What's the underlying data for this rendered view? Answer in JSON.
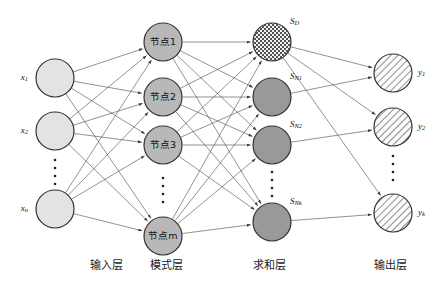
{
  "diagram": {
    "layers": [
      {
        "id": "input",
        "label": "输入层",
        "label_x": 106,
        "fill": "#e3e3e3",
        "pattern": "solid",
        "nodes": [
          {
            "name": "x1",
            "base": "x",
            "sub": "1",
            "cx": 55,
            "cy": 78,
            "r": 19
          },
          {
            "name": "x2",
            "base": "x",
            "sub": "2",
            "cx": 55,
            "cy": 131,
            "r": 19
          },
          {
            "name": "xn",
            "base": "x",
            "sub": "n",
            "cx": 55,
            "cy": 209,
            "r": 19
          }
        ],
        "ellipsis": {
          "cx": 55,
          "cy": 172
        }
      },
      {
        "id": "pattern",
        "label": "模式层",
        "label_x": 166,
        "fill": "#b8b8b8",
        "pattern": "solid",
        "nodes": [
          {
            "name": "pattern-node-1",
            "text": "节点1",
            "cx": 163,
            "cy": 42,
            "r": 19
          },
          {
            "name": "pattern-node-2",
            "text": "节点2",
            "cx": 163,
            "cy": 97,
            "r": 19
          },
          {
            "name": "pattern-node-3",
            "text": "节点3",
            "cx": 163,
            "cy": 145,
            "r": 19
          },
          {
            "name": "pattern-node-m",
            "text": "节点m",
            "cx": 163,
            "cy": 236,
            "r": 19
          }
        ],
        "ellipsis": {
          "cx": 163,
          "cy": 190
        }
      },
      {
        "id": "summation",
        "label": "求和层",
        "label_x": 269,
        "fill": "#999999",
        "pattern": "mixed",
        "nodes": [
          {
            "name": "sum-node-D",
            "base": "S",
            "sub": "D",
            "cx": 272,
            "cy": 42,
            "r": 19,
            "fill_kind": "checker",
            "label_dx": 18,
            "label_dy": -20
          },
          {
            "name": "sum-node-N1",
            "base": "S",
            "sub": "N1",
            "cx": 272,
            "cy": 97,
            "r": 19,
            "fill_kind": "dark",
            "label_dx": 18,
            "label_dy": -20
          },
          {
            "name": "sum-node-N2",
            "base": "S",
            "sub": "N2",
            "cx": 272,
            "cy": 145,
            "r": 19,
            "fill_kind": "dark",
            "label_dx": 18,
            "label_dy": -20
          },
          {
            "name": "sum-node-Nk",
            "base": "S",
            "sub": "Nk",
            "cx": 272,
            "cy": 222,
            "r": 19,
            "fill_kind": "dark",
            "label_dx": 18,
            "label_dy": -20
          }
        ],
        "ellipsis": {
          "cx": 272,
          "cy": 184
        }
      },
      {
        "id": "output",
        "label": "输出层",
        "label_x": 390,
        "fill": "#f2f2f2",
        "pattern": "hatch",
        "nodes": [
          {
            "name": "y1",
            "base": "y",
            "sub": "1",
            "cx": 393,
            "cy": 73,
            "r": 19
          },
          {
            "name": "y2",
            "base": "y",
            "sub": "2",
            "cx": 393,
            "cy": 127,
            "r": 19
          },
          {
            "name": "yk",
            "base": "y",
            "sub": "k",
            "cx": 393,
            "cy": 213,
            "r": 19
          }
        ],
        "ellipsis": {
          "cx": 393,
          "cy": 168
        }
      }
    ],
    "label_y": 262,
    "edge_color": "#4a4a4a",
    "node_stroke": "#333333",
    "layer_label_color": "#1a1a1a"
  }
}
